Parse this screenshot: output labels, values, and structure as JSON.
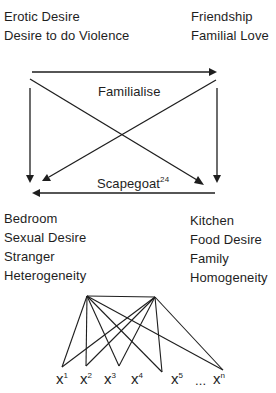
{
  "top_left": {
    "items": [
      "Erotic Desire",
      "Desire to do Violence"
    ]
  },
  "top_right": {
    "items": [
      "Friendship",
      "Familial Love"
    ]
  },
  "arrows": {
    "familialise_label": "Familialise",
    "scapegoat_label": "Scapegoat",
    "scapegoat_note": "24"
  },
  "bottom_left": {
    "items": [
      "Bedroom",
      "Sexual Desire",
      "Stranger",
      "Heterogeneity"
    ]
  },
  "bottom_right": {
    "items": [
      "Kitchen",
      "Food Desire",
      "Family",
      "Homogeneity"
    ]
  },
  "graph": {
    "nodes": [
      {
        "label": "x",
        "sup": "1"
      },
      {
        "label": "x",
        "sup": "2"
      },
      {
        "label": "x",
        "sup": "3"
      },
      {
        "label": "x",
        "sup": "4"
      },
      {
        "label": "x",
        "sup": "5"
      },
      {
        "label": "...",
        "sup": ""
      },
      {
        "label": "x",
        "sup": "n"
      }
    ]
  },
  "colors": {
    "ink": "#1e1e1e",
    "background": "#ffffff"
  }
}
